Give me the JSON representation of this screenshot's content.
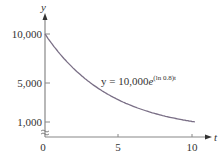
{
  "chart_data": {
    "type": "line",
    "title": "",
    "xlabel": "t",
    "ylabel": "y",
    "xlim": [
      0,
      10.5
    ],
    "ylim": [
      0,
      10000
    ],
    "x_ticks": [
      "0",
      "5",
      "10"
    ],
    "y_ticks": [
      "1,000",
      "5,000",
      "10,000"
    ],
    "y_axis_break": true,
    "grid": false,
    "series": [
      {
        "name": "y = 10,000e^{(ln 0.8)t}",
        "color": "#7a6f86",
        "x": [
          0,
          1,
          2,
          3,
          4,
          5,
          6,
          7,
          8,
          9,
          10
        ],
        "values": [
          10000,
          8000,
          6400,
          5120,
          4096,
          3277,
          2621,
          2097,
          1678,
          1342,
          1074
        ]
      }
    ],
    "annotation": {
      "prefix": "y = 10,000",
      "base": "e",
      "exponent": "(ln 0.8)t"
    }
  }
}
